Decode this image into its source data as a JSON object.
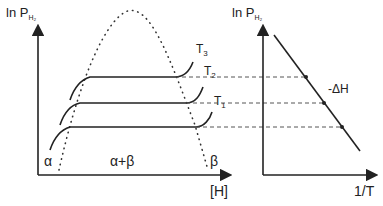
{
  "left_plot": {
    "y_axis_label": "ln P",
    "y_axis_subscript": "H₂",
    "x_axis_label": "[H]",
    "phase_alpha": "α",
    "phase_alpha_beta": "α+β",
    "phase_beta": "β",
    "isotherms": [
      {
        "label": "T",
        "sub": "3"
      },
      {
        "label": "T",
        "sub": "2"
      },
      {
        "label": "T",
        "sub": "1"
      }
    ]
  },
  "right_plot": {
    "y_axis_label": "ln P",
    "y_axis_subscript": "H₂",
    "x_axis_label": "1/T",
    "slope_label": "-ΔH"
  },
  "colors": {
    "line": "#222222",
    "dashed": "#555555"
  }
}
